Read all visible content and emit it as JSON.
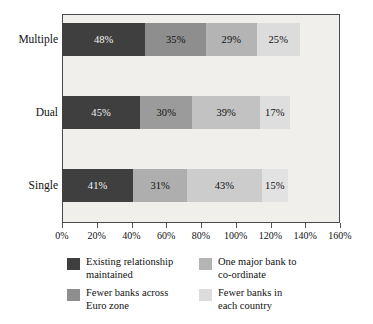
{
  "chart_data": {
    "type": "bar",
    "orientation": "horizontal",
    "stacked": true,
    "title": "",
    "subtitle": "",
    "xlabel": "",
    "ylabel": "",
    "categories": [
      "Multiple",
      "Dual",
      "Single"
    ],
    "series": [
      {
        "name": "Existing relationship maintained",
        "color": "#3f3f3f",
        "values": [
          48,
          35,
          29
        ],
        "labels": [
          "48%",
          "45%",
          "41%"
        ]
      },
      {
        "name": "One major bank to co-ordinate",
        "color": "#b4b4b4",
        "values": [
          35,
          30,
          31
        ],
        "labels": [
          "35%",
          "30%",
          "31%"
        ]
      },
      {
        "name": "Fewer banks across Euro zone",
        "color": "#8e8e8e",
        "values": [
          29,
          39,
          43
        ],
        "labels": [
          "29%",
          "39%",
          "43%"
        ]
      },
      {
        "name": "Fewer banks in each country",
        "color": "#dcdcdc",
        "values": [
          25,
          17,
          15
        ],
        "labels": [
          "25%",
          "17%",
          "15%"
        ]
      }
    ],
    "stacks": [
      {
        "category": "Multiple",
        "segments": [
          {
            "label": "48%",
            "value": 48,
            "color": "#3f3f3f",
            "series": "Existing relationship maintained"
          },
          {
            "label": "35%",
            "value": 35,
            "color": "#8e8e8e",
            "series": "One major bank to co-ordinate"
          },
          {
            "label": "29%",
            "value": 29,
            "color": "#b4b4b4",
            "series": "Fewer banks across Euro zone"
          },
          {
            "label": "25%",
            "value": 25,
            "color": "#dcdcdc",
            "series": "Fewer banks in each country"
          }
        ],
        "total": 137
      },
      {
        "category": "Dual",
        "segments": [
          {
            "label": "45%",
            "value": 45,
            "color": "#3f3f3f",
            "series": "Existing relationship maintained"
          },
          {
            "label": "30%",
            "value": 30,
            "color": "#9b9b9b",
            "series": "One major bank to co-ordinate"
          },
          {
            "label": "39%",
            "value": 39,
            "color": "#c2c2c2",
            "series": "Fewer banks across Euro zone"
          },
          {
            "label": "17%",
            "value": 17,
            "color": "#dedede",
            "series": "Fewer banks in each country"
          }
        ],
        "total": 131
      },
      {
        "category": "Single",
        "segments": [
          {
            "label": "41%",
            "value": 41,
            "color": "#3f3f3f",
            "series": "Existing relationship maintained"
          },
          {
            "label": "31%",
            "value": 31,
            "color": "#aeaeae",
            "series": "One major bank to co-ordinate"
          },
          {
            "label": "43%",
            "value": 43,
            "color": "#cccccc",
            "series": "Fewer banks across Euro zone"
          },
          {
            "label": "15%",
            "value": 15,
            "color": "#e2e2e2",
            "series": "Fewer banks in each country"
          }
        ],
        "total": 130
      }
    ],
    "xlim": [
      0,
      160
    ],
    "xticks": [
      0,
      20,
      40,
      60,
      80,
      100,
      120,
      140,
      160
    ],
    "xticklabels": [
      "0%",
      "20%",
      "40%",
      "60%",
      "80%",
      "100%",
      "120%",
      "140%",
      "160%"
    ],
    "grid": false,
    "legend_position": "bottom",
    "plot_background": "#f0efec",
    "frame_color": "#4a4a4a"
  },
  "legend": {
    "items": [
      {
        "label": "Existing relationship\nmaintained",
        "color": "#3f3f3f"
      },
      {
        "label": "One major bank to\nco-ordinate",
        "color": "#b4b4b4"
      },
      {
        "label": "Fewer banks across\nEuro zone",
        "color": "#8e8e8e"
      },
      {
        "label": "Fewer banks in\neach country",
        "color": "#dcdcdc"
      }
    ]
  }
}
